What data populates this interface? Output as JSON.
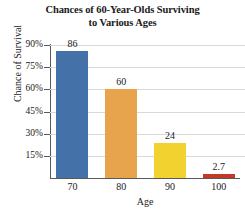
{
  "chart_data": {
    "type": "bar",
    "title": "Chances of 60-Year-Olds Surviving to Various Ages",
    "title_line1": "Chances of 60-Year-Olds Surviving",
    "title_line2": "to Various Ages",
    "xlabel": "Age",
    "ylabel": "Chance of Survival",
    "categories": [
      "70",
      "80",
      "90",
      "100"
    ],
    "values": [
      86,
      24,
      60,
      2.7
    ],
    "value_labels": [
      "86",
      "60",
      "24",
      "2.7"
    ],
    "series": [
      {
        "name": "Chance of Survival",
        "values": [
          86,
          60,
          24,
          2.7
        ]
      }
    ],
    "bars": [
      {
        "category": "70",
        "value": 86,
        "label": "86",
        "color": "#4472a8"
      },
      {
        "category": "80",
        "value": 60,
        "label": "60",
        "color": "#e8a44c"
      },
      {
        "category": "90",
        "value": 24,
        "label": "24",
        "color": "#f2d22e"
      },
      {
        "category": "100",
        "value": 2.7,
        "label": "2.7",
        "color": "#c0392b"
      }
    ],
    "ytick_labels": [
      "90%",
      "75%",
      "60%",
      "45%",
      "30%",
      "15%"
    ],
    "ytick_values": [
      90,
      75,
      60,
      45,
      30,
      15
    ],
    "ylim": [
      0,
      90
    ],
    "yunit": "%",
    "grid": true,
    "legend": "none",
    "gridline_color": "#d9d9d9",
    "axis_color": "#595959",
    "background": "#ffffff"
  }
}
